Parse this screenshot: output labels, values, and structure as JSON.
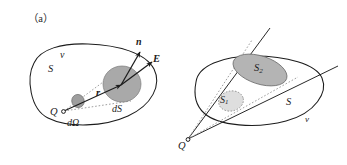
{
  "figure": {
    "background_color": "#ffffff",
    "stroke_color": "#1c1c1c",
    "shade_dark": "#a9a9a9",
    "shade_light": "#d8d8d8",
    "dotted_color": "#8c8c8c"
  },
  "panels": [
    {
      "caption": "（a）",
      "labels": {
        "volume": "v",
        "surface": "S",
        "charge": "Q",
        "solid_angle": "dΩ",
        "area_element": "dS",
        "radius_vector": "r",
        "normal_vector": "n",
        "field_vector": "E"
      }
    },
    {
      "caption": "（b）",
      "labels": {
        "volume": "v",
        "surface": "S",
        "charge": "Q",
        "region_1": "S",
        "region_1_sub": "1",
        "region_2": "S",
        "region_2_sub": "2"
      }
    }
  ]
}
